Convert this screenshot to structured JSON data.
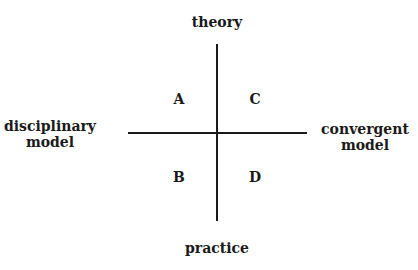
{
  "diagram": {
    "axes": {
      "top": "theory",
      "bottom": "practice",
      "left": [
        "disciplinary",
        "model"
      ],
      "right": [
        "convergent",
        "model"
      ]
    },
    "quadrants": {
      "top_left": "A",
      "top_right": "C",
      "bottom_left": "B",
      "bottom_right": "D"
    }
  }
}
